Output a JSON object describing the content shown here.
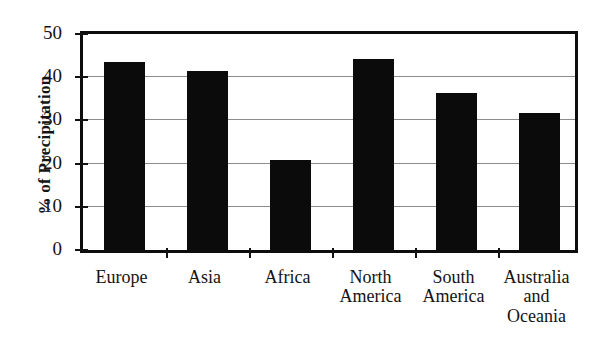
{
  "chart_data": {
    "type": "bar",
    "title": "",
    "xlabel": "",
    "ylabel": "% of Precipitation",
    "ylim": [
      0,
      50
    ],
    "yticks": [
      0,
      10,
      20,
      30,
      40,
      50
    ],
    "grid": true,
    "legend": false,
    "categories": [
      "Europe",
      "Asia",
      "Africa",
      "North America",
      "South America",
      "Australia and Oceania"
    ],
    "category_lines": [
      [
        "Europe"
      ],
      [
        "Asia"
      ],
      [
        "Africa"
      ],
      [
        "North",
        "America"
      ],
      [
        "South",
        "America"
      ],
      [
        "Australia",
        "and",
        "Oceania"
      ]
    ],
    "values": [
      43.5,
      41.5,
      20.8,
      44.2,
      36.3,
      31.7
    ],
    "bar_color": "#0b0b0b",
    "grid_color": "#8d8d8d",
    "axis_color": "#0d0d0d"
  }
}
